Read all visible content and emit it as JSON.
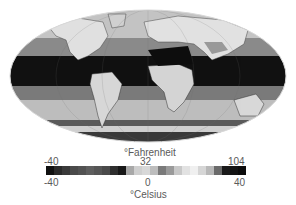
{
  "figure": {
    "type": "global-temperature-map",
    "projection": "Mollweide (elliptical)",
    "palette": "grayscale"
  },
  "legend": {
    "fahrenheit": {
      "unit_label": "°Fahrenheit",
      "ticks": [
        "-40",
        "32",
        "104"
      ]
    },
    "celsius": {
      "unit_label": "°Celsius",
      "ticks": [
        "-40",
        "0",
        "40"
      ]
    },
    "colorbar_segments": [
      "#111111",
      "#2a2a2a",
      "#3a3a3a",
      "#4a4a4a",
      "#525252",
      "#5e5e5e",
      "#555555",
      "#4a4a4a",
      "#2e2e2e",
      "#181818",
      "#a8a8a8",
      "#cfcfcf",
      "#d8d8d8",
      "#bdbdbd",
      "#7a7a7a",
      "#9a9a9a",
      "#c8c8c8",
      "#e2e2e2",
      "#f0f0f0",
      "#d6d6d6",
      "#b8b8b8",
      "#6a6a6a",
      "#1a1a1a",
      "#141414",
      "#0c0c0c"
    ]
  },
  "colors": {
    "background": "#ffffff",
    "ocean_warm": "#111111",
    "ocean_mid": "#7a7a7a",
    "ocean_cool": "#bcbcbc",
    "land_light": "#e6e6e6",
    "polar_dark": "#3a3a3a",
    "text": "#5a5a5a"
  }
}
